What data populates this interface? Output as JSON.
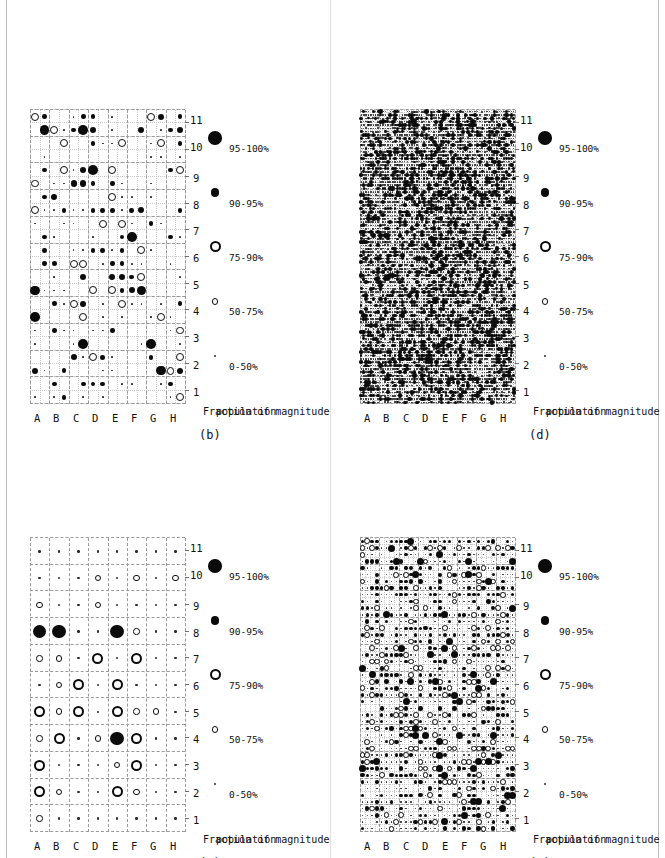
{
  "figure": {
    "orientation": "rotated-90-ccw",
    "background": "#ffffff",
    "ink": "#0b0b0b",
    "gridline_color": "#9a9a9a",
    "panels_order": [
      "b",
      "d",
      "a",
      "c"
    ]
  },
  "axis": {
    "x_title_line1": "Fraction of magnitude",
    "x_title_line2": "population",
    "y_categories": [
      "A",
      "B",
      "C",
      "D",
      "E",
      "F",
      "G",
      "H"
    ],
    "x_ticks": [
      "1",
      "2",
      "3",
      "4",
      "5",
      "6",
      "7",
      "8",
      "9",
      "10",
      "11"
    ],
    "x_min": 1,
    "x_max": 11
  },
  "legend": {
    "entries": [
      {
        "label": "0-50%",
        "marker": "tiny-dot",
        "size_px": 2.2,
        "fill": "solid"
      },
      {
        "label": "50-75%",
        "marker": "small-circle",
        "size_px": 6.0,
        "fill": "open"
      },
      {
        "label": "75-90%",
        "marker": "large-circle",
        "size_px": 10.5,
        "fill": "open"
      },
      {
        "label": "90-95%",
        "marker": "medium-dot",
        "size_px": 8.0,
        "fill": "solid"
      },
      {
        "label": "95-100%",
        "marker": "large-dot",
        "size_px": 13.0,
        "fill": "solid"
      }
    ]
  },
  "panels": [
    {
      "id": "a",
      "tag": "(a)",
      "cols": 8,
      "rows": 11,
      "position": "bottom-left",
      "description": "coarsest resolution bubble grid"
    },
    {
      "id": "b",
      "tag": "(b)",
      "cols": 16,
      "rows": 22,
      "position": "top-left",
      "description": "2x resolution bubble grid"
    },
    {
      "id": "c",
      "tag": "(c)",
      "cols": 32,
      "rows": 44,
      "position": "bottom-right",
      "description": "4x resolution bubble grid"
    },
    {
      "id": "d",
      "tag": "(d)",
      "cols": 64,
      "rows": 88,
      "position": "top-right",
      "description": "8x resolution bubble grid"
    }
  ],
  "chart_data": {
    "type": "scatter",
    "title": "",
    "xlabel": "Fraction of magnitude population",
    "ylabel": "",
    "xlim": [
      0.5,
      11.5
    ],
    "grid": true,
    "legend_position": "below-axis",
    "marker_encoding": {
      "0-50%": "tiny solid dot",
      "50-75%": "small open circle",
      "75-90%": "large open circle",
      "90-95%": "medium solid dot",
      "95-100%": "large solid dot"
    },
    "categories": [
      "A",
      "B",
      "C",
      "D",
      "E",
      "F",
      "G",
      "H"
    ],
    "x": [
      1,
      2,
      3,
      4,
      5,
      6,
      7,
      8,
      9,
      10,
      11
    ],
    "panels": {
      "a": {
        "cols": 8,
        "rows": 11,
        "points": [
          [
            0,
            0,
            2
          ],
          [
            0,
            1,
            3
          ],
          [
            0,
            2,
            3
          ],
          [
            0,
            3,
            2
          ],
          [
            0,
            4,
            3
          ],
          [
            0,
            5,
            1
          ],
          [
            0,
            6,
            2
          ],
          [
            0,
            7,
            5
          ],
          [
            0,
            8,
            2
          ],
          [
            0,
            9,
            1
          ],
          [
            0,
            10,
            1
          ],
          [
            1,
            0,
            1
          ],
          [
            1,
            1,
            2
          ],
          [
            1,
            2,
            1
          ],
          [
            1,
            3,
            3
          ],
          [
            1,
            4,
            2
          ],
          [
            1,
            5,
            2
          ],
          [
            1,
            6,
            2
          ],
          [
            1,
            7,
            5
          ],
          [
            1,
            8,
            1
          ],
          [
            1,
            9,
            1
          ],
          [
            1,
            10,
            1
          ],
          [
            2,
            0,
            1
          ],
          [
            2,
            1,
            1
          ],
          [
            2,
            2,
            1
          ],
          [
            2,
            3,
            1
          ],
          [
            2,
            4,
            3
          ],
          [
            2,
            5,
            3
          ],
          [
            2,
            6,
            1
          ],
          [
            2,
            7,
            1
          ],
          [
            2,
            8,
            1
          ],
          [
            2,
            9,
            1
          ],
          [
            2,
            10,
            1
          ],
          [
            3,
            0,
            1
          ],
          [
            3,
            1,
            1
          ],
          [
            3,
            2,
            1
          ],
          [
            3,
            3,
            2
          ],
          [
            3,
            4,
            1
          ],
          [
            3,
            5,
            1
          ],
          [
            3,
            6,
            3
          ],
          [
            3,
            7,
            1
          ],
          [
            3,
            8,
            2
          ],
          [
            3,
            9,
            2
          ],
          [
            3,
            10,
            1
          ],
          [
            4,
            0,
            1
          ],
          [
            4,
            1,
            3
          ],
          [
            4,
            2,
            2
          ],
          [
            4,
            3,
            5
          ],
          [
            4,
            4,
            3
          ],
          [
            4,
            5,
            3
          ],
          [
            4,
            6,
            1
          ],
          [
            4,
            7,
            5
          ],
          [
            4,
            8,
            1
          ],
          [
            4,
            9,
            1
          ],
          [
            4,
            10,
            1
          ],
          [
            5,
            0,
            1
          ],
          [
            5,
            1,
            2
          ],
          [
            5,
            2,
            3
          ],
          [
            5,
            3,
            3
          ],
          [
            5,
            4,
            2
          ],
          [
            5,
            5,
            1
          ],
          [
            5,
            6,
            3
          ],
          [
            5,
            7,
            2
          ],
          [
            5,
            8,
            1
          ],
          [
            5,
            9,
            2
          ],
          [
            5,
            10,
            1
          ],
          [
            6,
            0,
            1
          ],
          [
            6,
            1,
            1
          ],
          [
            6,
            2,
            1
          ],
          [
            6,
            3,
            1
          ],
          [
            6,
            4,
            2
          ],
          [
            6,
            5,
            1
          ],
          [
            6,
            6,
            1
          ],
          [
            6,
            7,
            1
          ],
          [
            6,
            8,
            1
          ],
          [
            6,
            9,
            1
          ],
          [
            6,
            10,
            1
          ],
          [
            7,
            0,
            1
          ],
          [
            7,
            1,
            1
          ],
          [
            7,
            2,
            1
          ],
          [
            7,
            3,
            1
          ],
          [
            7,
            4,
            1
          ],
          [
            7,
            5,
            1
          ],
          [
            7,
            6,
            1
          ],
          [
            7,
            7,
            1
          ],
          [
            7,
            8,
            1
          ],
          [
            7,
            9,
            2
          ],
          [
            7,
            10,
            1
          ]
        ]
      },
      "b": {
        "cols": 16,
        "rows": 22,
        "density": 0.55
      },
      "c": {
        "cols": 32,
        "rows": 44,
        "density": 0.78
      },
      "d": {
        "cols": 64,
        "rows": 88,
        "density": 0.92
      }
    }
  }
}
